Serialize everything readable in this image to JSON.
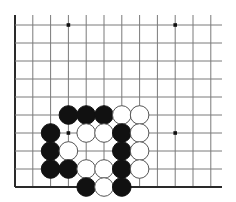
{
  "board": {
    "description": "Go problem diagram, lower-left corner region",
    "origin_x": 15,
    "origin_y": 25,
    "spacing_x": 17.8,
    "spacing_y": 18,
    "cols": 12,
    "rows": 10,
    "line_top_extend": 15,
    "line_right_extend": 222,
    "left_edge": true,
    "bottom_edge": true,
    "stone_radius": 9.3,
    "colors": {
      "grid": "#7a7a7a",
      "edge": "#2a2a2a",
      "black_stone": "#111111",
      "white_stone": "#ffffff",
      "white_outline": "#555555",
      "background": "#ffffff"
    },
    "star_points": [
      {
        "col": 3,
        "row": 0
      },
      {
        "col": 9,
        "row": 0
      },
      {
        "col": 3,
        "row": 6
      },
      {
        "col": 9,
        "row": 6
      }
    ],
    "stones": [
      {
        "color": "black",
        "col": 3,
        "row": 5
      },
      {
        "color": "black",
        "col": 4,
        "row": 5
      },
      {
        "color": "black",
        "col": 5,
        "row": 5
      },
      {
        "color": "white",
        "col": 6,
        "row": 5
      },
      {
        "color": "white",
        "col": 7,
        "row": 5
      },
      {
        "color": "black",
        "col": 2,
        "row": 6
      },
      {
        "color": "white",
        "col": 4,
        "row": 6
      },
      {
        "color": "white",
        "col": 5,
        "row": 6
      },
      {
        "color": "black",
        "col": 6,
        "row": 6
      },
      {
        "color": "white",
        "col": 7,
        "row": 6
      },
      {
        "color": "black",
        "col": 2,
        "row": 7
      },
      {
        "color": "white",
        "col": 3,
        "row": 7
      },
      {
        "color": "black",
        "col": 6,
        "row": 7
      },
      {
        "color": "white",
        "col": 7,
        "row": 7
      },
      {
        "color": "black",
        "col": 2,
        "row": 8
      },
      {
        "color": "black",
        "col": 3,
        "row": 8
      },
      {
        "color": "white",
        "col": 4,
        "row": 8
      },
      {
        "color": "white",
        "col": 5,
        "row": 8
      },
      {
        "color": "black",
        "col": 6,
        "row": 8
      },
      {
        "color": "white",
        "col": 7,
        "row": 8
      },
      {
        "color": "black",
        "col": 4,
        "row": 9
      },
      {
        "color": "white",
        "col": 5,
        "row": 9
      },
      {
        "color": "black",
        "col": 6,
        "row": 9
      }
    ]
  }
}
